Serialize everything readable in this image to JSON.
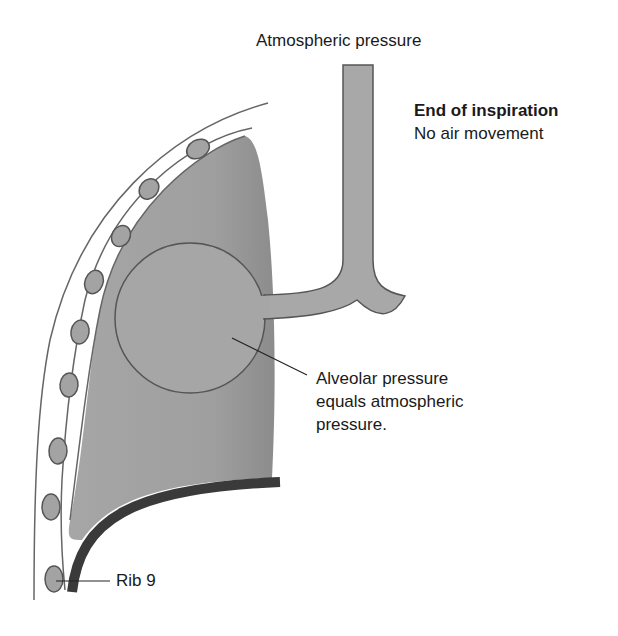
{
  "diagram": {
    "title_label": "Atmospheric pressure",
    "state": {
      "heading": "End of inspiration",
      "subheading": "No air movement"
    },
    "alveolar_label": {
      "line1": "Alveolar pressure",
      "line2": "equals atmospheric",
      "line3": "pressure."
    },
    "rib_label": "Rib 9",
    "colors": {
      "lung_fill": "#9e9e9e",
      "airway_fill": "#a8a8a8",
      "outline": "#555555",
      "diaphragm": "#3a3a3a",
      "rib_fill": "#a0a0a0"
    }
  }
}
